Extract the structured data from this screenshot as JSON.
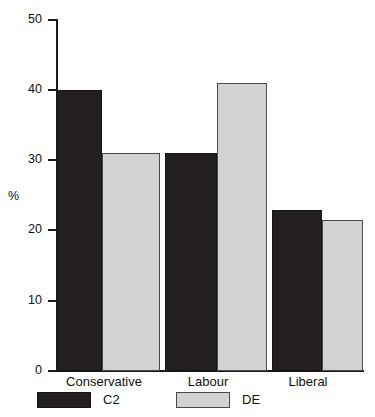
{
  "chart_data": {
    "type": "bar",
    "title": "",
    "subtitle": "",
    "xlabel": "",
    "ylabel": "%",
    "categories": [
      "Conservative",
      "Labour",
      "Liberal"
    ],
    "series": [
      {
        "name": "C2",
        "color": "#231f20",
        "values": [
          40,
          31,
          23
        ]
      },
      {
        "name": "DE",
        "color": "#d2d2d2",
        "values": [
          31,
          41,
          21.5
        ]
      }
    ],
    "ylim": [
      0,
      50
    ],
    "ytick_labels": [
      "0",
      "10",
      "20",
      "30",
      "40",
      "50"
    ],
    "ytick_values": [
      0,
      10,
      20,
      30,
      40,
      50
    ],
    "grid": false,
    "legend_position": "bottom",
    "annotations": []
  },
  "axes": {
    "y_label": "%",
    "ticks": [
      {
        "label": "50",
        "value": 50
      },
      {
        "label": "40",
        "value": 40
      },
      {
        "label": "30",
        "value": 30
      },
      {
        "label": "20",
        "value": 20
      },
      {
        "label": "10",
        "value": 10
      },
      {
        "label": "0",
        "value": 0
      }
    ]
  },
  "categories": [
    {
      "label": "Conservative"
    },
    {
      "label": "Labour"
    },
    {
      "label": "Liberal"
    }
  ],
  "legend": {
    "items": [
      {
        "label": "C2",
        "color": "#231f20"
      },
      {
        "label": "DE",
        "color": "#d2d2d2"
      }
    ]
  },
  "colors": {
    "c2": "#231f20",
    "de": "#d2d2d2",
    "axis": "#1a1a1a",
    "background": "#ffffff"
  }
}
